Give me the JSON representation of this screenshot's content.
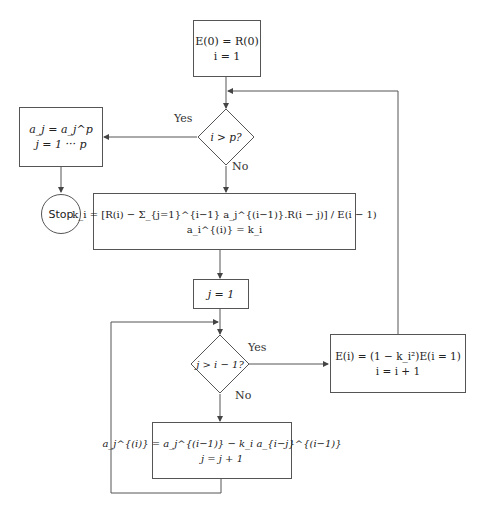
{
  "diagram": {
    "type": "flowchart",
    "nodes": {
      "init": {
        "lines": [
          "E(0) = R(0)",
          "i = 1"
        ]
      },
      "cond_i": {
        "text": "i > p?"
      },
      "final": {
        "lines": [
          "a_j = a_j^p",
          "j = 1 ··· p"
        ]
      },
      "stop": {
        "text": "Stop"
      },
      "reflection": {
        "lines": [
          "k_i = [R(i) − Σ_{j=1}^{i−1} a_j^{(i−1)}.R(i − j)] / E(i − 1)",
          "a_i^{(i)} = k_i"
        ]
      },
      "j_init": {
        "text": "j = 1"
      },
      "cond_j": {
        "text": "j > i − 1?"
      },
      "update_error": {
        "lines": [
          "E(i) = (1 − k_i²)E(i = 1)",
          "i = i + 1"
        ]
      },
      "update_coef": {
        "lines": [
          "a_j^{(i)} = a_j^{(i−1)} − k_i a_{i−j}^{(i−1)}",
          "j = j + 1"
        ]
      }
    },
    "edge_labels": {
      "cond_i_yes": "Yes",
      "cond_i_no": "No",
      "cond_j_yes": "Yes",
      "cond_j_no": "No"
    }
  }
}
